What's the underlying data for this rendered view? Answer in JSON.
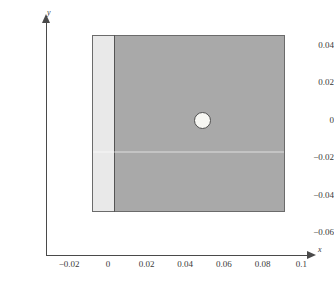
{
  "figure": {
    "background_color": "#ffffff",
    "axis_color": "#4a4a4a"
  },
  "axes": {
    "x_axis_label": "x",
    "y_axis_label": "y",
    "x_ticks": [
      "-0.02",
      "0",
      "0.02",
      "0.04",
      "0.06",
      "0.08",
      "0.1"
    ],
    "y_ticks": [
      "0.04",
      "0.02",
      "0",
      "-0.02",
      "-0.04",
      "-0.06"
    ]
  },
  "chart_data": {
    "type": "scatter",
    "title": "",
    "subtitle": "",
    "xlabel": "x",
    "ylabel": "y",
    "xlim": [
      -0.032,
      0.104
    ],
    "ylim": [
      -0.072,
      0.052
    ],
    "xticks": [
      -0.02,
      0,
      0.02,
      0.04,
      0.06,
      0.08,
      0.1
    ],
    "xticklabels": [
      "-0.02",
      "0",
      "0.02",
      "0.04",
      "0.06",
      "0.08",
      "0.1"
    ],
    "yticks": [
      0.04,
      0.02,
      0,
      -0.02,
      -0.04,
      -0.06
    ],
    "yticklabels": [
      "0.04",
      "0.02",
      "0",
      "-0.02",
      "-0.04",
      "-0.06"
    ],
    "grid": false,
    "legend": false,
    "legend_position": "none",
    "axis_style": "arrowed-spines-offset",
    "aspect": "equal",
    "annotations": [],
    "series": [
      {
        "name": "coating-strip",
        "shape": "rectangle",
        "fill_color": "#e9e9e9",
        "edge_color": "#6b6b6b",
        "x_range": [
          -0.0108,
          0.0
        ],
        "y_range": [
          -0.0452,
          0.0452
        ],
        "width": 0.0108,
        "height": 0.0904
      },
      {
        "name": "substrate-block",
        "shape": "rectangle",
        "fill_color": "#a9a9a9",
        "edge_color": "#6b6b6b",
        "x_range": [
          0.0,
          0.0894
        ],
        "y_range": [
          -0.0452,
          0.0452
        ],
        "width": 0.0894,
        "height": 0.0904
      },
      {
        "name": "hole-circle",
        "shape": "circle",
        "fill_color": "#f7f7f3",
        "edge_color": "#4f4f4f",
        "center": [
          0.0453,
          0.0008
        ],
        "radius": 0.0045,
        "diameter": 0.009
      }
    ]
  }
}
